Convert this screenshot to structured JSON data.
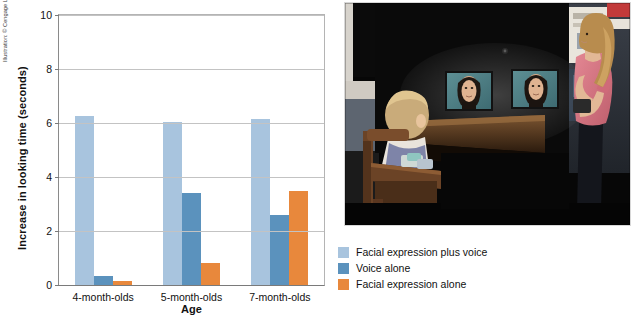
{
  "figure": {
    "attribution": "Illustration: © Cengage Learning®; photo by: Mark Philbrick/Brigham Young University"
  },
  "chart_data": {
    "type": "bar",
    "title": "",
    "xlabel": "Age",
    "ylabel": "Increase in looking time (seconds)",
    "categories": [
      "4-month-olds",
      "5-month-olds",
      "7-month-olds"
    ],
    "ylim": [
      0,
      10
    ],
    "yticks": [
      0,
      2,
      4,
      6,
      8,
      10
    ],
    "ytick_labels": [
      "0",
      "2",
      "4",
      "6",
      "8",
      "10"
    ],
    "grid": true,
    "legend_position": "below-right",
    "series": [
      {
        "name": "Facial expression plus voice",
        "color": "#a8c4de",
        "values": [
          6.25,
          6.05,
          6.15
        ]
      },
      {
        "name": "Voice alone",
        "color": "#5b92bd",
        "values": [
          0.35,
          3.4,
          2.6
        ]
      },
      {
        "name": "Facial expression alone",
        "color": "#e8883c",
        "values": [
          0.15,
          0.8,
          3.5
        ]
      }
    ]
  },
  "photo": {
    "caption_alt": "Infant seated in a high chair in a darkened laboratory viewing two video monitors showing a woman's face while a researcher stands at the right",
    "colors": {
      "background": "#080808",
      "wall": "#2b2f36",
      "monitor_face_bg": "#4e7f86",
      "researcher_shirt": "#d9727e",
      "infant_hair": "#c9ab7a",
      "chair_wood": "#6b4326"
    }
  }
}
